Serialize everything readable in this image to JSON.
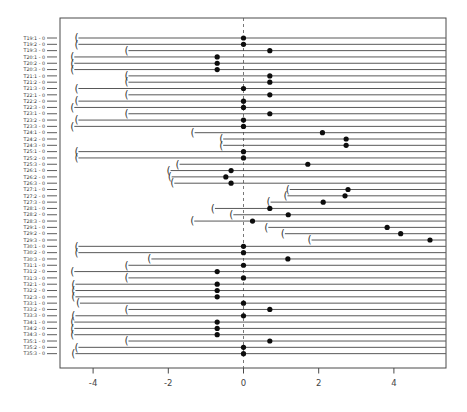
{
  "figure": {
    "background": "#ffffff",
    "box_color": "#4a4a4a",
    "line_color": "#3a3a3a",
    "dot_color": "#0d0d0d",
    "ref_line_color": "#555555",
    "label_color": "#333333",
    "tick_label_color": "#444444"
  },
  "chart_data": {
    "type": "scatter",
    "variant": "horizontal-interval-caterpillar",
    "title": "",
    "xlabel": "",
    "ylabel": "",
    "xlim": [
      -4.9,
      5.4
    ],
    "x_ticks": [
      -4,
      -2,
      0,
      2,
      4
    ],
    "x_tick_labels": [
      "-4",
      "-2",
      "0",
      "2",
      "4"
    ],
    "reference_line_x": 0,
    "reference_line_style": "dashed",
    "intervals_right_truncated_at": 5.38,
    "grid": false,
    "legend": null,
    "rows": [
      {
        "label": "T19:1 - 0",
        "start": -4.43,
        "dot": 0.0
      },
      {
        "label": "T19:2 - 0",
        "start": -4.43,
        "dot": 0.0
      },
      {
        "label": "T19:3 - 0",
        "start": -3.1,
        "dot": 0.7
      },
      {
        "label": "T20:1 - 0",
        "start": -4.54,
        "dot": -0.7
      },
      {
        "label": "T20:2 - 0",
        "start": -4.54,
        "dot": -0.7
      },
      {
        "label": "T20:3 - 0",
        "start": -4.54,
        "dot": -0.7
      },
      {
        "label": "T21:1 - 0",
        "start": -3.1,
        "dot": 0.7
      },
      {
        "label": "T21:2 - 0",
        "start": -3.1,
        "dot": 0.7
      },
      {
        "label": "T21:3 - 0",
        "start": -4.43,
        "dot": 0.0
      },
      {
        "label": "T22:1 - 0",
        "start": -3.1,
        "dot": 0.7
      },
      {
        "label": "T22:2 - 0",
        "start": -4.43,
        "dot": 0.0
      },
      {
        "label": "T22:3 - 0",
        "start": -4.54,
        "dot": 0.0
      },
      {
        "label": "T23:1 - 0",
        "start": -3.1,
        "dot": 0.7
      },
      {
        "label": "T23:2 - 0",
        "start": -4.43,
        "dot": 0.0
      },
      {
        "label": "T23:3 - 0",
        "start": -4.54,
        "dot": 0.0
      },
      {
        "label": "T24:1 - 0",
        "start": -1.34,
        "dot": 2.1
      },
      {
        "label": "T24:2 - 0",
        "start": -0.58,
        "dot": 2.73
      },
      {
        "label": "T24:3 - 0",
        "start": -0.58,
        "dot": 2.73
      },
      {
        "label": "T25:1 - 0",
        "start": -4.43,
        "dot": 0.0
      },
      {
        "label": "T25:2 - 0",
        "start": -4.43,
        "dot": 0.0
      },
      {
        "label": "T25:3 - 0",
        "start": -1.74,
        "dot": 1.71
      },
      {
        "label": "T26:1 - 0",
        "start": -1.98,
        "dot": -0.33
      },
      {
        "label": "T26:2 - 0",
        "start": -1.95,
        "dot": -0.47
      },
      {
        "label": "T26:3 - 0",
        "start": -1.88,
        "dot": -0.33
      },
      {
        "label": "T27:1 - 0",
        "start": 1.19,
        "dot": 2.78
      },
      {
        "label": "T27:2 - 0",
        "start": 1.13,
        "dot": 2.7
      },
      {
        "label": "T27:3 - 0",
        "start": 0.68,
        "dot": 2.12
      },
      {
        "label": "T28:1 - 0",
        "start": -0.8,
        "dot": 0.7
      },
      {
        "label": "T28:2 - 0",
        "start": -0.31,
        "dot": 1.19
      },
      {
        "label": "T28:3 - 0",
        "start": -1.35,
        "dot": 0.24
      },
      {
        "label": "T29:1 - 0",
        "start": 0.62,
        "dot": 3.82
      },
      {
        "label": "T29:2 - 0",
        "start": 1.06,
        "dot": 4.18
      },
      {
        "label": "T29:3 - 0",
        "start": 1.77,
        "dot": 4.96
      },
      {
        "label": "T30:1 - 0",
        "start": -4.43,
        "dot": 0.0
      },
      {
        "label": "T30:2 - 0",
        "start": -4.43,
        "dot": 0.0
      },
      {
        "label": "T30:3 - 0",
        "start": -2.49,
        "dot": 1.18
      },
      {
        "label": "T31:1 - 0",
        "start": -3.1,
        "dot": 0.0
      },
      {
        "label": "T31:2 - 0",
        "start": -4.54,
        "dot": -0.7
      },
      {
        "label": "T31:3 - 0",
        "start": -3.1,
        "dot": 0.0
      },
      {
        "label": "T32:1 - 0",
        "start": -4.51,
        "dot": -0.7
      },
      {
        "label": "T32:2 - 0",
        "start": -4.51,
        "dot": -0.7
      },
      {
        "label": "T32:3 - 0",
        "start": -4.51,
        "dot": -0.7
      },
      {
        "label": "T33:1 - 0",
        "start": -4.39,
        "dot": 0.0
      },
      {
        "label": "T33:2 - 0",
        "start": -3.1,
        "dot": 0.7
      },
      {
        "label": "T33:3 - 0",
        "start": -4.51,
        "dot": 0.0
      },
      {
        "label": "T34:1 - 0",
        "start": -4.54,
        "dot": -0.7
      },
      {
        "label": "T34:2 - 0",
        "start": -4.54,
        "dot": -0.7
      },
      {
        "label": "T34:3 - 0",
        "start": -4.54,
        "dot": -0.7
      },
      {
        "label": "T35:1 - 0",
        "start": -3.1,
        "dot": 0.7
      },
      {
        "label": "T35:2 - 0",
        "start": -4.43,
        "dot": 0.0
      },
      {
        "label": "T35:3 - 0",
        "start": -4.51,
        "dot": 0.0
      }
    ]
  }
}
